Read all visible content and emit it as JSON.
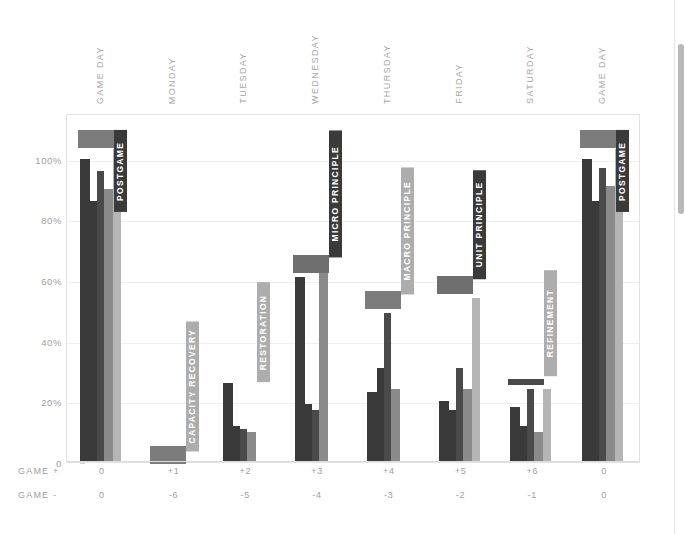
{
  "chart_data": {
    "type": "bar",
    "title": "",
    "subtitle": "",
    "xlabel": "",
    "ylabel": "",
    "ylim": [
      0,
      115
    ],
    "grid": true,
    "legend_position": "none",
    "categories": [
      "GAME DAY",
      "MONDAY",
      "TUESDAY",
      "WEDNESDAY",
      "THURSDAY",
      "FRIDAY",
      "SATURDAY",
      "GAME DAY"
    ],
    "ytick_labels": [
      "0",
      "20%",
      "40%",
      "60%",
      "80%",
      "100%"
    ],
    "ytick_values": [
      0,
      20,
      40,
      60,
      80,
      100
    ],
    "axis_rows": [
      {
        "title": "GAME +",
        "values": [
          "0",
          "+1",
          "+2",
          "+3",
          "+4",
          "+5",
          "+6",
          "0"
        ]
      },
      {
        "title": "GAME -",
        "values": [
          "0",
          "-6",
          "-5",
          "-4",
          "-3",
          "-2",
          "-1",
          "0"
        ]
      }
    ],
    "series": [
      {
        "name": "bar-1",
        "color": "#3a3a3a",
        "values": [
          100,
          0,
          26,
          61,
          23,
          20,
          18,
          100
        ]
      },
      {
        "name": "bar-2",
        "color": "#3a3a3a",
        "values": [
          86,
          0,
          12,
          19,
          31,
          17,
          12,
          86
        ]
      },
      {
        "name": "bar-3",
        "color": "#4a4a4a",
        "values": [
          96,
          0,
          11,
          17,
          49,
          31,
          24,
          97
        ]
      },
      {
        "name": "bar-4",
        "color": "#8a8a8a",
        "values": [
          90,
          0,
          10,
          63,
          24,
          24,
          10,
          91
        ]
      },
      {
        "name": "bar-5-light",
        "color": "#b5b5b5",
        "values": [
          103,
          0,
          0,
          0,
          0,
          54,
          24,
          103
        ]
      }
    ],
    "phase_bands": [
      {
        "label": "POSTGAME",
        "group": 0,
        "band_from": 104,
        "band_to": 110,
        "band_color": "#7c7c7c",
        "label_color": "#3a3a3a",
        "label_from": 83,
        "label_to": 110
      },
      {
        "label": "CAPACITY RECOVERY",
        "group": 1,
        "band_from": 0,
        "band_to": 6,
        "band_color": "#7c7c7c",
        "label_color": "#adadad",
        "label_from": 4,
        "label_to": 47
      },
      {
        "label": "RESTORATION",
        "group": 2,
        "band_from": 0,
        "band_to": 0,
        "band_color": "#7c7c7c",
        "label_color": "#adadad",
        "label_from": 27,
        "label_to": 60
      },
      {
        "label": "MICRO PRINCIPLE",
        "group": 3,
        "band_from": 63,
        "band_to": 69,
        "band_color": "#6f6f6f",
        "label_color": "#3a3a3a",
        "label_from": 68,
        "label_to": 110
      },
      {
        "label": "MACRO PRINCIPLE",
        "group": 4,
        "band_from": 51,
        "band_to": 57,
        "band_color": "#7c7c7c",
        "label_color": "#adadad",
        "label_from": 56,
        "label_to": 98
      },
      {
        "label": "UNIT PRINCIPLE",
        "group": 5,
        "band_from": 56,
        "band_to": 62,
        "band_color": "#6f6f6f",
        "label_color": "#3a3a3a",
        "label_from": 61,
        "label_to": 97
      },
      {
        "label": "REFINEMENT",
        "group": 6,
        "band_from": 26,
        "band_to": 28,
        "band_color": "#4a4a4a",
        "label_color": "#adadad",
        "label_from": 29,
        "label_to": 64
      },
      {
        "label": "POSTGAME",
        "group": 7,
        "band_from": 104,
        "band_to": 110,
        "band_color": "#7c7c7c",
        "label_color": "#3a3a3a",
        "label_from": 83,
        "label_to": 110
      }
    ]
  }
}
